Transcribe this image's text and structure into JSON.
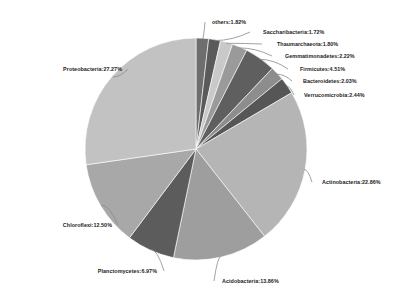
{
  "chart_data": {
    "type": "pie",
    "title": "",
    "subtitle": "",
    "xlabel": "",
    "ylabel": "",
    "legend_position": "none",
    "grid": false,
    "label_format": "name:value%",
    "unit": "%",
    "total": 100.0,
    "categories": [
      "others",
      "Saccharibacteria",
      "Thaumarchaeota",
      "Gemmatimonadetes",
      "Firmicutes",
      "Bacteroidetes",
      "Verrucomicrobia",
      "Actinobacteria",
      "Acidobacteria",
      "Planctomycetes",
      "Chloroflexi",
      "Proteobacteria"
    ],
    "values": [
      1.82,
      1.72,
      1.8,
      2.22,
      4.51,
      2.03,
      2.44,
      22.86,
      13.86,
      6.97,
      12.5,
      27.27
    ],
    "colors": [
      "#6e6e6e",
      "#5a5a5a",
      "#c9c9c9",
      "#9a9a9a",
      "#5f5f5f",
      "#8d8d8d",
      "#565656",
      "#b5b5b5",
      "#9e9e9e",
      "#5c5c5c",
      "#a8a8a8",
      "#c2c2c2"
    ],
    "slices": [
      {
        "name": "others",
        "value": 1.82,
        "label": "others:1.82%",
        "color": "#6e6e6e"
      },
      {
        "name": "Saccharibacteria",
        "value": 1.72,
        "label": "Saccharibacteria:1.72%",
        "color": "#5a5a5a"
      },
      {
        "name": "Thaumarchaeota",
        "value": 1.8,
        "label": "Thaumarchaeota:1.80%",
        "color": "#c9c9c9"
      },
      {
        "name": "Gemmatimonadetes",
        "value": 2.22,
        "label": "Gemmatimonadetes:2.22%",
        "color": "#9a9a9a"
      },
      {
        "name": "Firmicutes",
        "value": 4.51,
        "label": "Firmicutes:4.51%",
        "color": "#5f5f5f"
      },
      {
        "name": "Bacteroidetes",
        "value": 2.03,
        "label": "Bacteroidetes:2.03%",
        "color": "#8d8d8d"
      },
      {
        "name": "Verrucomicrobia",
        "value": 2.44,
        "label": "Verrucomicrobia:2.44%",
        "color": "#565656"
      },
      {
        "name": "Actinobacteria",
        "value": 22.86,
        "label": "Actinobacteria:22.86%",
        "color": "#b5b5b5"
      },
      {
        "name": "Acidobacteria",
        "value": 13.86,
        "label": "Acidobacteria:13.86%",
        "color": "#9e9e9e"
      },
      {
        "name": "Planctomycetes",
        "value": 6.97,
        "label": "Planctomycetes:6.97%",
        "color": "#5c5c5c"
      },
      {
        "name": "Chloroflexi",
        "value": 12.5,
        "label": "Chloroflexi:12.50%",
        "color": "#a8a8a8"
      },
      {
        "name": "Proteobacteria",
        "value": 27.27,
        "label": "Proteobacteria:27.27%",
        "color": "#c2c2c2"
      }
    ]
  },
  "labels": {
    "others": "others:1.82%",
    "saccharibacteria": "Saccharibacteria:1.72%",
    "thaumarchaeota": "Thaumarchaeota:1.80%",
    "gemmatimonadetes": "Gemmatimonadetes:2.22%",
    "firmicutes": "Firmicutes:4.51%",
    "bacteroidetes": "Bacteroidetes:2.03%",
    "verrucomicrobia": "Verrucomicrobia:2.44%",
    "actinobacteria": "Actinobacteria:22.86%",
    "acidobacteria": "Acidobacteria:13.86%",
    "planctomycetes": "Planctomycetes:6.97%",
    "chloroflexi": "Chloroflexi:12.50%",
    "proteobacteria": "Proteobacteria:27.27%"
  },
  "style": {
    "background": "#ffffff",
    "leader_line_color": "#8a8a8a",
    "label_text_color": "#1c1c1c",
    "slice_border_color": "#ffffff"
  },
  "geometry": {
    "center_x": 196,
    "center_y": 149,
    "radius": 111,
    "start_angle_deg": -90
  }
}
